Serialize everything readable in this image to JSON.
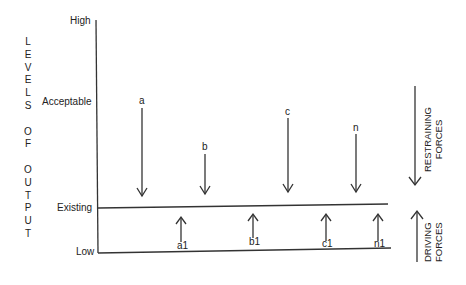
{
  "diagram": {
    "type": "force-field-analysis",
    "y_axis_title_letters": [
      "L",
      "E",
      "V",
      "E",
      "L",
      "S",
      "",
      "O",
      "F",
      "",
      "O",
      "U",
      "T",
      "P",
      "U",
      "T"
    ],
    "y_axis_title": "LEVELS OF OUTPUT",
    "levels": {
      "high": "High",
      "acceptable": "Acceptable",
      "existing": "Existing",
      "low": "Low"
    },
    "restraining_arrows": [
      {
        "label": "a",
        "x": 142,
        "top": 108,
        "bottom": 196
      },
      {
        "label": "b",
        "x": 205,
        "top": 154,
        "bottom": 194
      },
      {
        "label": "c",
        "x": 288,
        "top": 118,
        "bottom": 192
      },
      {
        "label": "n",
        "x": 356,
        "top": 134,
        "bottom": 192
      }
    ],
    "driving_arrows": [
      {
        "label": "a1",
        "x": 181,
        "top": 220,
        "bottom": 241
      },
      {
        "label": "b1",
        "x": 253,
        "top": 216,
        "bottom": 238
      },
      {
        "label": "c1",
        "x": 326,
        "top": 216,
        "bottom": 240
      },
      {
        "label": "n1",
        "x": 378,
        "top": 216,
        "bottom": 240
      }
    ],
    "legend": {
      "restraining": {
        "line1": "RESTRAINING",
        "line2": "FORCES"
      },
      "driving": {
        "line1": "DRIVING",
        "line2": "FORCES"
      }
    }
  }
}
